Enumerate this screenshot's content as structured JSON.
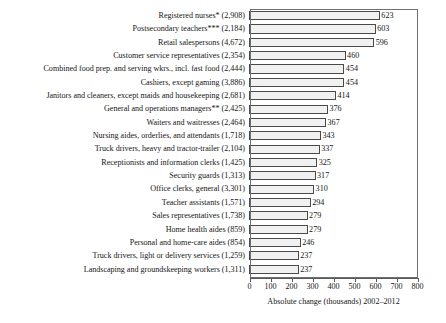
{
  "chart_data": {
    "type": "bar",
    "orientation": "horizontal",
    "title": "",
    "xlabel": "Absolute change (thousands) 2002–2012",
    "ylabel": "",
    "xlim": [
      0,
      800
    ],
    "xticks": [
      0,
      100,
      200,
      300,
      400,
      500,
      600,
      700,
      800
    ],
    "xtick_labels": [
      "0",
      "100",
      "200",
      "300",
      "400",
      "500",
      "600",
      "700",
      "800"
    ],
    "grid": false,
    "legend": null,
    "value_labels_shown": true,
    "categories": [
      "Registered nurses* (2,908)",
      "Postsecondary teachers*** (2,184)",
      "Retail salespersons (4,672)",
      "Customer service representatives (2,354)",
      "Combined food prep. and serving wkrs., incl. fast food (2,444)",
      "Cashiers, except gaming (3,886)",
      "Janitors and cleaners, except maids and housekeeping (2,681)",
      "General and operations managers** (2,425)",
      "Waiters and waitresses (2,464)",
      "Nursing aides, orderlies, and attendants (1,718)",
      "Truck drivers, heavy and tractor-trailer (2,104)",
      "Receptionists and information clerks (1,425)",
      "Security guards (1,313)",
      "Office clerks, general (3,301)",
      "Teacher assistants (1,571)",
      "Sales representatives (1,738)",
      "Home health aides (859)",
      "Personal and home-care aides (854)",
      "Truck drivers, light or delivery services (1,259)",
      "Landscaping and groundskeeping workers (1,311)"
    ],
    "values": [
      623,
      603,
      596,
      460,
      454,
      454,
      414,
      376,
      367,
      343,
      337,
      325,
      317,
      310,
      294,
      279,
      279,
      246,
      237,
      237
    ],
    "value_label_texts": [
      "623",
      "603",
      "596",
      "460",
      "454",
      "454",
      "414",
      "376",
      "367",
      "343",
      "337",
      "325",
      "317",
      "310",
      "294",
      "279",
      "279",
      "246",
      "237",
      "237"
    ],
    "base_employment_thousands_2002": [
      2908,
      2184,
      4672,
      2354,
      2444,
      3886,
      2681,
      2425,
      2464,
      1718,
      2104,
      1425,
      1313,
      3301,
      1571,
      1738,
      859,
      854,
      1259,
      1311
    ],
    "colors": {
      "bar_fill": "#f1f1f1",
      "bar_pattern_dot": "#b9b9b9",
      "bar_border": "#4a4a4a",
      "frame": "#6f6f6f",
      "axis": "#5a5a5a",
      "text": "#161616",
      "background": "#ffffff"
    }
  }
}
